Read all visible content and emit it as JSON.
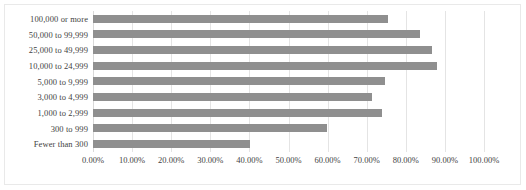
{
  "chart_data": {
    "type": "bar",
    "orientation": "horizontal",
    "title": "",
    "xlabel": "",
    "ylabel": "",
    "xlim": [
      0,
      100
    ],
    "xtick_labels": [
      "0.00%",
      "10.00%",
      "20.00%",
      "30.00%",
      "40.00%",
      "50.00%",
      "60.00%",
      "70.00%",
      "80.00%",
      "90.00%",
      "100.00%"
    ],
    "xticks": [
      0,
      10,
      20,
      30,
      40,
      50,
      60,
      70,
      80,
      90,
      100
    ],
    "grid": true,
    "legend": "none",
    "bar_color": "#8f8f8f",
    "categories": [
      "100,000 or more",
      "50,000 to 99,999",
      "25,000 to 49,999",
      "10,000 to 24,999",
      "5,000 to 9,999",
      "3,000 to 4,999",
      "1,000 to 2,999",
      "300 to 999",
      "Fewer than 300"
    ],
    "values": [
      75.5,
      83.6,
      86.7,
      88.0,
      74.7,
      71.4,
      74.0,
      59.9,
      40.2
    ]
  }
}
